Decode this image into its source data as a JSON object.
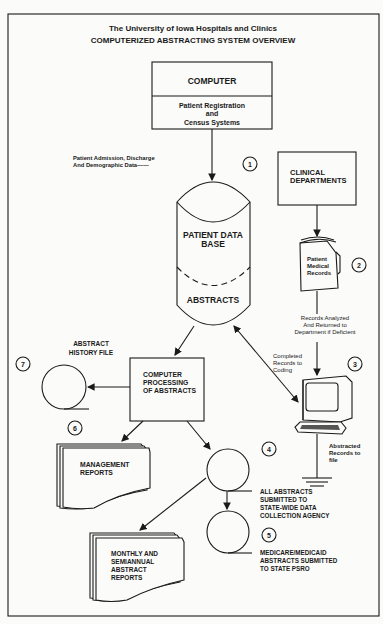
{
  "title": {
    "line1": "The University of Iowa Hospitals and Clinics",
    "line2": "COMPUTERIZED ABSTRACTING SYSTEM OVERVIEW"
  },
  "nodes": {
    "computer": {
      "header": "COMPUTER",
      "sub1": "Patient Registration",
      "sub2": "and",
      "sub3": "Census Systems"
    },
    "patient_data_base": {
      "line1": "PATIENT DATA",
      "line2": "BASE",
      "lower": "ABSTRACTS"
    },
    "clinical_departments": {
      "line1": "CLINICAL",
      "line2": "DEPARTMENTS"
    },
    "medical_records": {
      "line1": "Patient",
      "line2": "Medical",
      "line3": "Records"
    },
    "processing": {
      "line1": "COMPUTER",
      "line2": "PROCESSING",
      "line3": "OF ABSTRACTS"
    },
    "history_file": {
      "line1": "ABSTRACT",
      "line2": "HISTORY FILE"
    },
    "management_reports": {
      "line1": "MANAGEMENT",
      "line2": "REPORTS"
    },
    "monthly_reports": {
      "line1": "MONTHLY AND",
      "line2": "SEMIANNUAL",
      "line3": "ABSTRACT",
      "line4": "REPORTS"
    },
    "state_agency": {
      "line1": "ALL ABSTRACTS",
      "line2": "SUBMITTED TO",
      "line3": "STATE-WIDE DATA",
      "line4": "COLLECTION AGENCY"
    },
    "state_psro": {
      "line1": "MEDICARE/MEDICAID",
      "line2": "ABSTRACTS SUBMITTED",
      "line3": "TO STATE PSRO"
    }
  },
  "edge_labels": {
    "admission": {
      "line1": "Patient Admission, Discharge",
      "line2": "And Demographic Data——"
    },
    "analyzed": {
      "line1": "Records Analyzed",
      "line2": "And Returned to",
      "line3": "Department if Deficient"
    },
    "coding": {
      "line1": "Completed",
      "line2": "Records to",
      "line3": "Coding"
    },
    "abstracted": {
      "line1": "Abstracted",
      "line2": "Records to",
      "line3": "file"
    }
  },
  "step_numbers": [
    "1",
    "2",
    "3",
    "4",
    "5",
    "6",
    "7"
  ]
}
